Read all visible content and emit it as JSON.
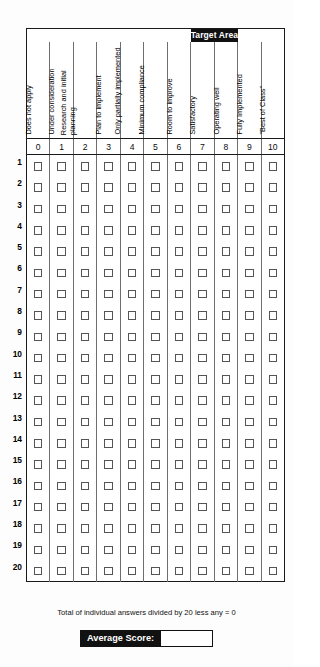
{
  "banner": {
    "target_area_label": "Target Area",
    "target_area_span_columns": [
      7,
      8
    ]
  },
  "columns": [
    {
      "score": "0",
      "label": "Does not apply",
      "lines": 1
    },
    {
      "score": "1",
      "label": "Under consideration",
      "lines": 1
    },
    {
      "score": "2",
      "label": "Research and initial planning",
      "lines": 2
    },
    {
      "score": "3",
      "label": "Plan to implement",
      "lines": 1
    },
    {
      "score": "4",
      "label": "Only partially implemented",
      "lines": 2
    },
    {
      "score": "5",
      "label": "Minimum compliance",
      "lines": 2
    },
    {
      "score": "6",
      "label": "Room to improve",
      "lines": 1
    },
    {
      "score": "7",
      "label": "Satisfactory",
      "lines": 1
    },
    {
      "score": "8",
      "label": "Operating well",
      "lines": 1
    },
    {
      "score": "9",
      "label": "Fully Implemented",
      "lines": 1
    },
    {
      "score": "10",
      "label": "\"Best of Class\"",
      "lines": 1
    }
  ],
  "rows": [
    {
      "number": "1"
    },
    {
      "number": "2"
    },
    {
      "number": "3"
    },
    {
      "number": "4"
    },
    {
      "number": "5"
    },
    {
      "number": "6"
    },
    {
      "number": "7"
    },
    {
      "number": "8"
    },
    {
      "number": "9"
    },
    {
      "number": "10"
    },
    {
      "number": "11"
    },
    {
      "number": "12"
    },
    {
      "number": "13"
    },
    {
      "number": "14"
    },
    {
      "number": "15"
    },
    {
      "number": "16"
    },
    {
      "number": "17"
    },
    {
      "number": "18"
    },
    {
      "number": "19"
    },
    {
      "number": "20"
    }
  ],
  "footer": {
    "note": "Total of individual answers divided by 20 less any = 0",
    "average_score_label": "Average Score:",
    "average_score_value": ""
  },
  "colors": {
    "banner_background": "#111111",
    "banner_text": "#ffffff",
    "table_border": "#1a1a1a",
    "cell_divider": "#6f6f6f",
    "checkbox_border": "#555555",
    "page_background": "#fdfdfd"
  }
}
